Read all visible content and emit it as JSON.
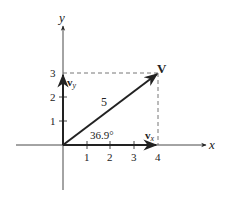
{
  "diagram": {
    "x_axis_label": "x",
    "y_axis_label": "y",
    "x_ticks": [
      "1",
      "2",
      "3",
      "4"
    ],
    "y_ticks": [
      "1",
      "2",
      "3"
    ],
    "vector_label": "V",
    "magnitude_label": "5",
    "angle_label": "36.9°",
    "component_x_label": "v",
    "component_x_sub": "x",
    "component_y_label": "v",
    "component_y_sub": "y",
    "vector": {
      "x": 4,
      "y": 3,
      "magnitude": 5,
      "angle_deg": 36.9
    },
    "colors": {
      "line": "#222222",
      "dashed": "#666666",
      "background": "#ffffff"
    }
  }
}
